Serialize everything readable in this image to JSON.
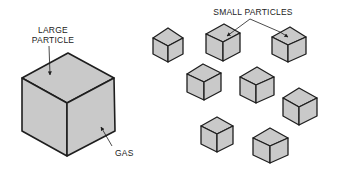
{
  "diagram": {
    "labels": {
      "large_particle_line1": "LARGE",
      "large_particle_line2": "PARTICLE",
      "gas": "GAS",
      "small_particles": "SMALL PARTICLES"
    },
    "colors": {
      "background": "#ffffff",
      "cube_face": "#c9c9c9",
      "outline": "#1e1e1e"
    },
    "large_cube": {
      "top": [
        68,
        53
      ],
      "left": [
        22,
        78
      ],
      "right": [
        114,
        78
      ],
      "center": [
        67,
        103
      ],
      "left_bottom": [
        22,
        131
      ],
      "right_bottom": [
        115,
        131
      ],
      "bottom": [
        67,
        156
      ]
    },
    "small_cubes": [
      {
        "top": [
          168,
          28
        ],
        "left": [
          153,
          38
        ],
        "right": [
          183,
          38
        ],
        "center": [
          168,
          46
        ],
        "bottom": [
          168,
          62
        ]
      },
      {
        "top": [
          224,
          24
        ],
        "left": [
          206,
          34
        ],
        "right": [
          240,
          33
        ],
        "center": [
          223,
          42
        ],
        "bottom": [
          223,
          61
        ]
      },
      {
        "top": [
          290,
          27
        ],
        "left": [
          272,
          37
        ],
        "right": [
          306,
          37
        ],
        "center": [
          288,
          45
        ],
        "bottom": [
          288,
          62
        ]
      },
      {
        "top": [
          203,
          64
        ],
        "left": [
          187,
          74
        ],
        "right": [
          221,
          73
        ],
        "center": [
          204,
          82
        ],
        "bottom": [
          204,
          100
        ]
      },
      {
        "top": [
          257,
          67
        ],
        "left": [
          240,
          77
        ],
        "right": [
          274,
          77
        ],
        "center": [
          256,
          85
        ],
        "bottom": [
          256,
          103
        ]
      },
      {
        "top": [
          299,
          88
        ],
        "left": [
          283,
          98
        ],
        "right": [
          317,
          98
        ],
        "center": [
          299,
          107
        ],
        "bottom": [
          299,
          125
        ]
      },
      {
        "top": [
          217,
          117
        ],
        "left": [
          201,
          126
        ],
        "right": [
          233,
          126
        ],
        "center": [
          217,
          134
        ],
        "bottom": [
          217,
          152
        ]
      },
      {
        "top": [
          270,
          128
        ],
        "left": [
          253,
          138
        ],
        "right": [
          288,
          138
        ],
        "center": [
          270,
          146
        ],
        "bottom": [
          270,
          163
        ]
      }
    ]
  }
}
